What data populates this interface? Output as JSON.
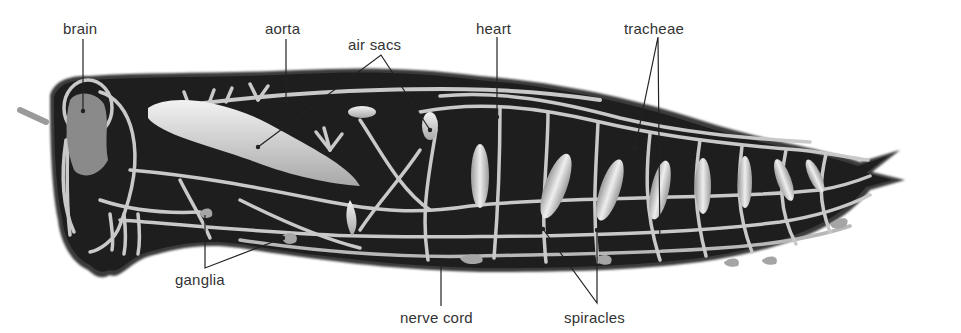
{
  "diagram": {
    "colors": {
      "body": "#1e1e1e",
      "body_edge": "#3a3a3a",
      "tubes": "#c9c9c9",
      "air_sac": "#dedede",
      "label_text": "#333333",
      "leader_line": "#222222",
      "background": "#ffffff"
    },
    "labels": {
      "brain": "brain",
      "aorta": "aorta",
      "air_sacs": "air sacs",
      "heart": "heart",
      "tracheae": "tracheae",
      "ganglia": "ganglia",
      "nerve_cord": "nerve cord",
      "spiracles": "spiracles"
    }
  }
}
